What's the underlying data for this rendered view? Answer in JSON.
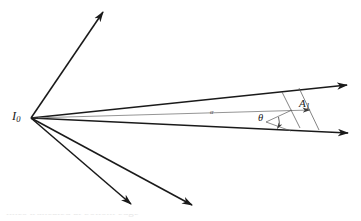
{
  "figure": {
    "type": "geometric-optics-ray-diagram",
    "background_color": "#ffffff",
    "ink_color": "#1a1a1a",
    "thin_ink_color": "#6b6b6b",
    "width": 361,
    "height": 221
  },
  "labels": {
    "origin": "I",
    "origin_sub": "0",
    "amplitude": "A",
    "amplitude_sub": "1",
    "theta": "θ",
    "alpha": "α"
  },
  "caption": {
    "text": "lines truncated at bottom edge"
  },
  "geometry": {
    "vertex": {
      "x": 31,
      "y": 118
    },
    "rays": [
      {
        "name": "ray-up-left",
        "x1": 31,
        "y1": 118,
        "x2": 104,
        "y2": 11,
        "weight": "bold",
        "arrow": true
      },
      {
        "name": "ray-upper-beam",
        "x1": 31,
        "y1": 118,
        "x2": 349,
        "y2": 85,
        "weight": "bold",
        "arrow": true
      },
      {
        "name": "ray-alpha-axis",
        "x1": 31,
        "y1": 118,
        "x2": 314,
        "y2": 110,
        "weight": "thin",
        "arrow": true
      },
      {
        "name": "ray-lower-beam",
        "x1": 31,
        "y1": 118,
        "x2": 350,
        "y2": 133,
        "weight": "bold",
        "arrow": true
      },
      {
        "name": "ray-down-right-1",
        "x1": 31,
        "y1": 118,
        "x2": 132,
        "y2": 205,
        "weight": "bold",
        "arrow": true
      },
      {
        "name": "ray-down-right-2",
        "x1": 31,
        "y1": 118,
        "x2": 193,
        "y2": 206,
        "weight": "bold",
        "arrow": true
      }
    ],
    "wavefronts": [
      {
        "name": "wavefront-near",
        "x1": 283,
        "y1": 93,
        "x2": 300,
        "y2": 127
      },
      {
        "name": "wavefront-far",
        "x1": 299,
        "y1": 89,
        "x2": 318,
        "y2": 129
      }
    ],
    "angle_arc": {
      "name": "theta-arc",
      "cx": 266,
      "cy": 122,
      "r": 13,
      "start_deg": -20,
      "end_deg": 18
    },
    "theta_legs": [
      {
        "name": "theta-leg-upper",
        "x1": 266,
        "y1": 122,
        "x2": 291,
        "y2": 110
      },
      {
        "name": "theta-leg-lower",
        "x1": 266,
        "y1": 122,
        "x2": 290,
        "y2": 130
      }
    ]
  }
}
